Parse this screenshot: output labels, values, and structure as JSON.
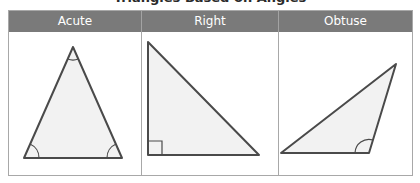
{
  "title": "Triangles Based on Angles",
  "columns": [
    {
      "label": "Acute",
      "shape": "acute-triangle",
      "marks": [
        "arc-top",
        "arc-bottom-left",
        "arc-bottom-right"
      ]
    },
    {
      "label": "Right",
      "shape": "right-triangle",
      "marks": [
        "right-angle-square"
      ]
    },
    {
      "label": "Obtuse",
      "shape": "obtuse-triangle",
      "marks": [
        "arc-obtuse"
      ]
    }
  ],
  "colors": {
    "header_bg": "#7a7a7a",
    "header_text": "#ffffff",
    "border": "#a8a8a8",
    "triangle_stroke": "#4a4a4a",
    "triangle_fill": "#f2f2f2"
  }
}
